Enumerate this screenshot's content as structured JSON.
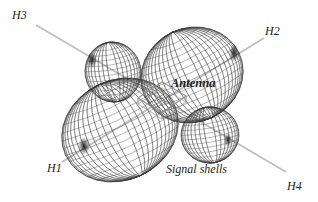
{
  "diagram": {
    "title": "Antenna signal shells",
    "labels": {
      "antenna": "Antenna",
      "signal_shells": "Signal shells"
    },
    "directions": [
      {
        "id": "H1",
        "label": "H1"
      },
      {
        "id": "H2",
        "label": "H2"
      },
      {
        "id": "H3",
        "label": "H3"
      },
      {
        "id": "H4",
        "label": "H4"
      }
    ],
    "colors": {
      "mesh": "#3a3a3a",
      "axis": "#b8b8b8",
      "text": "#222222",
      "background": "#ffffff"
    }
  }
}
